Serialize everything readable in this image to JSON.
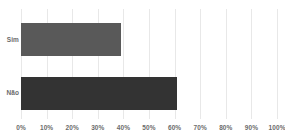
{
  "chart_data": {
    "type": "bar",
    "orientation": "horizontal",
    "title": "",
    "subtitle": "",
    "xlabel": "",
    "ylabel": "",
    "categories": [
      "Sim",
      "Não"
    ],
    "values": [
      39,
      61
    ],
    "value_suffix": "%",
    "xlim": [
      0,
      100
    ],
    "xticks": [
      0,
      10,
      20,
      30,
      40,
      50,
      60,
      70,
      80,
      90,
      100
    ],
    "xticklabels": [
      "0%",
      "10%",
      "20%",
      "30%",
      "40%",
      "50%",
      "60%",
      "70%",
      "80%",
      "90%",
      "100%"
    ],
    "grid": true,
    "grid_axis": "x",
    "legend": false,
    "legend_position": "none",
    "series": [
      {
        "name": "",
        "values": [
          39,
          61
        ]
      }
    ],
    "bar_colors": [
      "#595959",
      "#333333"
    ],
    "colors": {
      "background": "#ffffff",
      "gridline": "#e8e8e8",
      "axis_line": "#c9c9c9",
      "tick_text": "#6b6b6b",
      "bar_sim": "#595959",
      "bar_nao": "#333333"
    }
  }
}
